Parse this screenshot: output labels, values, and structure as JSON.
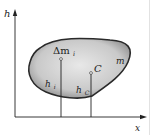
{
  "figure": {
    "axes": {
      "y_label": "h",
      "x_label": "x"
    },
    "body": {
      "mass_label": "m",
      "element_label": "Δm",
      "element_subscript": "i",
      "center_label": "C",
      "height_element_label": "h",
      "height_element_subscript": "i",
      "height_center_label": "h",
      "height_center_subscript": "C"
    },
    "colors": {
      "body_fill_light": "#e6e6e6",
      "body_fill_dark": "#8a8a8a",
      "outline": "#2a2a2a",
      "axis": "#222222"
    }
  }
}
